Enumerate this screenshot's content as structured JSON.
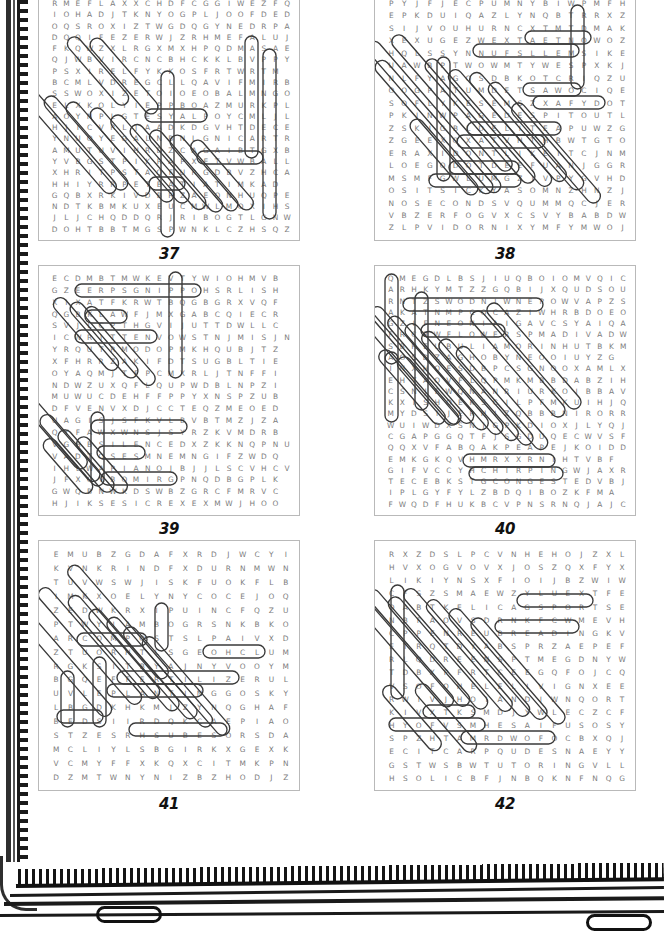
{
  "page": {
    "kind": "word-search-puzzle-book-page",
    "binding": "spiral-comb",
    "background_color": "#ffffff",
    "letter_color": "#7b7b7b",
    "circle_color": "#3a3a3a",
    "box_border_color": "#b9b9b9",
    "number_color": "#111111"
  },
  "puzzles": [
    {
      "number": "37",
      "rows": [
        "RMEFLAXXCHDFCGGIWEZFQ",
        "IOHADJTKNYOGPLJOOFDED",
        "OQSROXIZTWGDQGYNEDRPA",
        "DQQIFEZERWJZRHMEFALUJ",
        "FKQWZXLRGXMXHPQDMASAE",
        "QJWBVIRCNCBHCKKLBVPPY",
        "PSXIRELFYKKOSFRTWRTM",
        "BCMLVDREGCLLQAVIFMIRB",
        "SSWOXIZETOIOEOBALMNGO",
        "ELXKOLYIEPPBOAZMURKPL",
        "AOYNPLGTESYALPOYCMLJL",
        "HJICVRLJAADKDGVHTDECE",
        "YNUOYEGALNBNLGNICARTR",
        "AMUTUVIHRDZCAGAIBTGXB",
        "YVBGSTPIKRAPXETVWBALL",
        "XHRITPSTAQFURGDBVZHCA",
        "HHIYRRPETBATIATIMKAD",
        "GQBXRKIVDBRZAEONHUQPE",
        "NDTKBMKUXEUCMWLMOXIHS",
        "JLJCHQDDQRJRIBOGTLGNW",
        "DOHTBBTMGSPWNKLCZHSQZ"
      ]
    },
    {
      "number": "38",
      "rows": [
        "PYJFJECPUMNYBIWPMFH",
        "EPKDUIQAZLYNQBTRRXZ",
        "SIJVOUHURNCXTMTDMAK",
        "XEXUGEZWEXTAETNOWOZ",
        "HQLSSYNNUFSLLEMSIKE",
        "UAWBPTWOWMTYWESPXKJ",
        "NLFYAGOSDBKOTCRIQZU",
        "OOGPATUMDETSAWOCIQE",
        "SOFLYKESEMSZXAFYDOT",
        "PKJNWPAGEDESPITOUTL",
        "ZSKIGBLDELITEAPUWZG",
        "ZGEEXQXATVHTHBWTGTO",
        "ERAXIDONTLIKEITCJNM",
        "LOEGODOTDEEFUANJGGR",
        "MSMFGWLUMGZIVPYGVHD",
        "OSITSICKYASOMNZHNZJ",
        "NOSECONDSVQUMMQCJER",
        "VBZERFOGVXCSVYBABDW",
        "ZLPVIDORNIXYMFYMWOJ"
      ]
    },
    {
      "number": "39",
      "rows": [
        "ECDMBTMWKEVTYWIOHMVB",
        "GZEERPSGNIPPOHSRLISH",
        "XIXATFKRWTBQGBGRXVQF",
        "QGBKLAWFJMXGABCQIECR",
        "SVJLCPTHGVIJUTTDWLLC",
        "ICWRITTENVOWSTNJMISJN",
        "YRQUTRMODOPMKHQUBJTZ",
        "XFHRRZAKIFDTSUGBLTIE",
        "OYAQMJTFPCMXRLJTNFFI",
        "NDWZUXQFLQUPWDBLNPZI",
        "MUWUCDEHFFPPYXNSPZUB",
        "DFVENVXDJCCTEQZMEOED",
        "UAGISJSFKVLBVBTMZJZA",
        "QYFAWXWNSJSYRZKVMDRB",
        "VGHBSILENCEDXZKKNQPNU",
        "VADTQSESMNEMNGIFZWDQ",
        "IHLWAPIANOJBJJLSCVHCV",
        "JFXQVBQMIRGPNQDBGPLK",
        "GWQBNWKDSWBZGRCFMRVC",
        "HJIKSESICREXEXMWJHOO"
      ]
    },
    {
      "number": "40",
      "rows": [
        "QMEGDLBSJIUQBOIOMVQIC",
        "ARHKYMTZZGQBIJXQUDSOU",
        "RNTZSWODNIWNEPOWVAPZS",
        "AKATNMPCQCAZIWHRBDOEO",
        "GZIFNEONIAIGAVCSYAIQA",
        "FRCRWFLOWERSPMADIVADW",
        "SBHEUBULIAMORINHUTBKM",
        "AOSDZAGHOBYNEOOIUYZG",
        "INXHOESDBPCSGNOOXAMLX",
        "EHTAOVFLQPMKMBBDABZIH",
        "CSNJEWQNANRIURKOIBBAV",
        "KXISHOEKSCILPFMKUIHJQ",
        "MYDSIJERHIZQBBBNIRORR",
        "WUIWDXSNJGPKDIOXJLYQJ",
        "CGAPGGQTFJSGDUQECWVSF",
        "QQXVFABQAKPEAPEJKOIDD",
        "EMKGKQVHMRXXRNIHTVBF",
        "GIFVCCYHCHIRPINGWJAXR",
        "TECEBKSTGCONGESTEDVBJ",
        "IPLGYFYLZBDQIBOZKFMA",
        "FWQDFHUKBCVPNSRNQJAJC"
      ]
    },
    {
      "number": "41",
      "rows": [
        "EMUBZGDAFXRDJWCYI",
        "KVNKRINDFXDURNMWN",
        "TUVWSWJISKFUOKFLB",
        "IMKXOELYNYCOCEJOQ",
        "ZEDWKRXIPUINCFQZU",
        "PTWYIAMBOGRSNKBKO",
        "ARCOMPOSTSLPAIVXD",
        "ZTUORHTLSGEOHCLUM",
        "RGKSITBYAJNYVOOYM",
        "BGQEFFERTILIZERUL",
        "UVLEPLANTINGGOSKY",
        "LBGDKHKMJZYNQGHAF",
        "BEDSIIRDQKCAEPIAO",
        "STZESRHSUBESORSDA",
        "MCLIYLSBGIRKXGEXK",
        "VCMYFFXKQXCITMKPN",
        "DZMTWNYNIZBZHODJZ"
      ]
    },
    {
      "number": "42",
      "rows": [
        "RXZDSLPCVNHEHOJZXL",
        "HVXOGVOVXJOSZQXFYX",
        "LIKIYNSXFIOIJBZWIW",
        "CFSZSMAEWZYLUEXTFE",
        "OABTKELICAGSPORTSE",
        "NBFAOVSDRNKFCWMEVH",
        "CPPENREUBREADINGKV",
        "ETRQTDYABSPRZAEPEF",
        "RLQDREENSPTMEGDNYW",
        "TDBXPFRTCEEGQFOJCQ",
        "VSOFOHELELIVIGNXEE",
        "RWIVJHOIANDIWNQORT",
        "KIVXTKSMDJYWLECZCF",
        "HYOFVSMHESAIFUSOSY",
        "SPZHTAMRDWOFOCBXQJ",
        "ECITCARPQUDESNAEYY",
        "GSTWSBWTUTORINGVLL",
        "HSOLICBFJNBQKNFNQG"
      ]
    }
  ],
  "found_words": {
    "37": [
      "EASY",
      "PART",
      "TRACING"
    ],
    "38": [
      "NOW TEAT",
      "SMELLS FUN",
      "WASTED",
      "DESPITE OUT",
      "I DONT LIKE IT",
      "GO DOT DEEP",
      "IT S SICKY",
      "NO SECONDS"
    ],
    "39": [
      "SHOPPING",
      "WALK",
      "WRITTEN VOW",
      "SILENCE",
      "PIANO",
      "EXERCISES"
    ],
    "40": [
      "WINDOWS",
      "OPEN",
      "FLOWERS",
      "SHOES",
      "CHIRPING",
      "CONGESTED"
    ],
    "41": [
      "COMPOST",
      "MULCH",
      "FERTILIZER",
      "PLANTING",
      "BEDS",
      "ROSEBUSH"
    ],
    "42": [
      "SPORTS",
      "READING",
      "MATH",
      "PRACTICE",
      "TUTORING"
    ]
  },
  "highlights": {
    "37": [
      {
        "x": 52,
        "y": 37,
        "w": 14,
        "h": 86,
        "rot": -41
      },
      {
        "x": 78,
        "y": 37,
        "w": 14,
        "h": 96,
        "rot": -41
      },
      {
        "x": 22,
        "y": 78,
        "w": 14,
        "h": 140,
        "rot": -41
      },
      {
        "x": 40,
        "y": 92,
        "w": 14,
        "h": 120,
        "rot": -41
      },
      {
        "x": 62,
        "y": 98,
        "w": 14,
        "h": 120,
        "rot": -41
      },
      {
        "x": 86,
        "y": 104,
        "w": 14,
        "h": 120,
        "rot": -41
      },
      {
        "x": 104,
        "y": 112,
        "w": 14,
        "h": 112,
        "rot": -41
      },
      {
        "x": 122,
        "y": 122,
        "w": 14,
        "h": 108,
        "rot": -41
      },
      {
        "x": 140,
        "y": 128,
        "w": 14,
        "h": 104,
        "rot": -41
      },
      {
        "x": 158,
        "y": 134,
        "w": 14,
        "h": 96,
        "rot": -41
      },
      {
        "x": 176,
        "y": 140,
        "w": 14,
        "h": 88,
        "rot": -41
      },
      {
        "x": 106,
        "y": 118,
        "w": 62,
        "h": 13,
        "rot": 0
      },
      {
        "x": 158,
        "y": 160,
        "w": 66,
        "h": 13,
        "rot": 0
      },
      {
        "x": 110,
        "y": 186,
        "w": 36,
        "h": 13,
        "rot": 0
      },
      {
        "x": 206,
        "y": 45,
        "w": 13,
        "h": 122,
        "rot": 0
      },
      {
        "x": 224,
        "y": 58,
        "w": 13,
        "h": 170,
        "rot": 0
      },
      {
        "x": 122,
        "y": 80,
        "w": 13,
        "h": 166,
        "rot": 0
      }
    ],
    "38": [
      {
        "x": 52,
        "y": 28,
        "w": 14,
        "h": 196,
        "rot": -41
      },
      {
        "x": 70,
        "y": 24,
        "w": 14,
        "h": 176,
        "rot": -41
      },
      {
        "x": 52,
        "y": 50,
        "w": 14,
        "h": 172,
        "rot": -41
      },
      {
        "x": 98,
        "y": 50,
        "w": 14,
        "h": 160,
        "rot": -41
      },
      {
        "x": 118,
        "y": 62,
        "w": 14,
        "h": 150,
        "rot": -41
      },
      {
        "x": 136,
        "y": 66,
        "w": 14,
        "h": 140,
        "rot": -41
      },
      {
        "x": 154,
        "y": 76,
        "w": 14,
        "h": 138,
        "rot": -41
      },
      {
        "x": 174,
        "y": 98,
        "w": 14,
        "h": 128,
        "rot": -41
      },
      {
        "x": 62,
        "y": 118,
        "w": 14,
        "h": 96,
        "rot": -41
      },
      {
        "x": 150,
        "y": 40,
        "w": 66,
        "h": 13,
        "rot": 0
      },
      {
        "x": 98,
        "y": 53,
        "w": 106,
        "h": 13,
        "rot": 0
      },
      {
        "x": 148,
        "y": 92,
        "w": 58,
        "h": 13,
        "rot": 0
      },
      {
        "x": 158,
        "y": 105,
        "w": 72,
        "h": 13,
        "rot": 0
      },
      {
        "x": 92,
        "y": 131,
        "w": 94,
        "h": 13,
        "rot": 0
      },
      {
        "x": 82,
        "y": 144,
        "w": 88,
        "h": 13,
        "rot": 0
      },
      {
        "x": 74,
        "y": 170,
        "w": 70,
        "h": 13,
        "rot": 0
      },
      {
        "x": 54,
        "y": 183,
        "w": 92,
        "h": 13,
        "rot": 0
      },
      {
        "x": 62,
        "y": 66,
        "w": 13,
        "h": 124,
        "rot": 0
      },
      {
        "x": 196,
        "y": 14,
        "w": 13,
        "h": 84,
        "rot": 0
      }
    ],
    "39": [
      {
        "x": 130,
        "y": 6,
        "w": 13,
        "h": 106,
        "rot": 0
      },
      {
        "x": 36,
        "y": 18,
        "w": 126,
        "h": 13,
        "rot": 0
      },
      {
        "x": 46,
        "y": 44,
        "w": 42,
        "h": 13,
        "rot": 0
      },
      {
        "x": 36,
        "y": 64,
        "w": 82,
        "h": 13,
        "rot": 0
      },
      {
        "x": 52,
        "y": 154,
        "w": 96,
        "h": 13,
        "rot": 0
      },
      {
        "x": 58,
        "y": 180,
        "w": 48,
        "h": 13,
        "rot": 0
      },
      {
        "x": 62,
        "y": 206,
        "w": 76,
        "h": 13,
        "rot": 0
      },
      {
        "x": 40,
        "y": 22,
        "w": 14,
        "h": 92,
        "rot": -41
      },
      {
        "x": 58,
        "y": 26,
        "w": 14,
        "h": 96,
        "rot": -41
      },
      {
        "x": 74,
        "y": 30,
        "w": 14,
        "h": 100,
        "rot": -41
      },
      {
        "x": 10,
        "y": 124,
        "w": 14,
        "h": 88,
        "rot": -41
      },
      {
        "x": 24,
        "y": 140,
        "w": 14,
        "h": 84,
        "rot": -41
      },
      {
        "x": 40,
        "y": 156,
        "w": 14,
        "h": 78,
        "rot": -41
      },
      {
        "x": 56,
        "y": 164,
        "w": 14,
        "h": 70,
        "rot": -41
      },
      {
        "x": 22,
        "y": 166,
        "w": 14,
        "h": 68,
        "rot": -41
      },
      {
        "x": 52,
        "y": 146,
        "w": 13,
        "h": 74,
        "rot": 0
      }
    ],
    "40": [
      {
        "x": 10,
        "y": 8,
        "w": 13,
        "h": 90,
        "rot": 0
      },
      {
        "x": 40,
        "y": 26,
        "w": 13,
        "h": 118,
        "rot": 0
      },
      {
        "x": 10,
        "y": 86,
        "w": 13,
        "h": 70,
        "rot": 0
      },
      {
        "x": 28,
        "y": 32,
        "w": 140,
        "h": 13,
        "rot": 0
      },
      {
        "x": 46,
        "y": 58,
        "w": 84,
        "h": 13,
        "rot": 0
      },
      {
        "x": 88,
        "y": 188,
        "w": 92,
        "h": 13,
        "rot": 0
      },
      {
        "x": 94,
        "y": 201,
        "w": 94,
        "h": 13,
        "rot": 0
      },
      {
        "x": 24,
        "y": 16,
        "w": 14,
        "h": 160,
        "rot": -41
      },
      {
        "x": 40,
        "y": 24,
        "w": 14,
        "h": 150,
        "rot": -41
      },
      {
        "x": 56,
        "y": 34,
        "w": 14,
        "h": 146,
        "rot": -41
      },
      {
        "x": 72,
        "y": 42,
        "w": 14,
        "h": 142,
        "rot": -41
      },
      {
        "x": 88,
        "y": 50,
        "w": 14,
        "h": 140,
        "rot": -41
      },
      {
        "x": 104,
        "y": 58,
        "w": 14,
        "h": 136,
        "rot": -41
      },
      {
        "x": 120,
        "y": 66,
        "w": 14,
        "h": 132,
        "rot": -41
      },
      {
        "x": 136,
        "y": 30,
        "w": 14,
        "h": 136,
        "rot": -41
      },
      {
        "x": 152,
        "y": 22,
        "w": 14,
        "h": 136,
        "rot": -41
      },
      {
        "x": 30,
        "y": 74,
        "w": 14,
        "h": 94,
        "rot": -41
      },
      {
        "x": 46,
        "y": 82,
        "w": 14,
        "h": 86,
        "rot": -41
      }
    ],
    "41": [
      {
        "x": 72,
        "y": 8,
        "w": 14,
        "h": 146,
        "rot": -41
      },
      {
        "x": 44,
        "y": 30,
        "w": 14,
        "h": 150,
        "rot": -41
      },
      {
        "x": 14,
        "y": 42,
        "w": 14,
        "h": 150,
        "rot": -41
      },
      {
        "x": 68,
        "y": 40,
        "w": 14,
        "h": 132,
        "rot": -41
      },
      {
        "x": 88,
        "y": 54,
        "w": 14,
        "h": 130,
        "rot": -41
      },
      {
        "x": 106,
        "y": 62,
        "w": 14,
        "h": 130,
        "rot": -41
      },
      {
        "x": 122,
        "y": 72,
        "w": 14,
        "h": 128,
        "rot": -41
      },
      {
        "x": 140,
        "y": 82,
        "w": 14,
        "h": 126,
        "rot": -41
      },
      {
        "x": 38,
        "y": 92,
        "w": 70,
        "h": 13,
        "rot": 0
      },
      {
        "x": 164,
        "y": 104,
        "w": 62,
        "h": 13,
        "rot": 0
      },
      {
        "x": 78,
        "y": 130,
        "w": 122,
        "h": 13,
        "rot": 0
      },
      {
        "x": 68,
        "y": 143,
        "w": 96,
        "h": 13,
        "rot": 0
      },
      {
        "x": 18,
        "y": 169,
        "w": 46,
        "h": 13,
        "rot": 0
      },
      {
        "x": 90,
        "y": 182,
        "w": 98,
        "h": 13,
        "rot": 0
      },
      {
        "x": 22,
        "y": 130,
        "w": 13,
        "h": 56,
        "rot": 0
      },
      {
        "x": 54,
        "y": 116,
        "w": 13,
        "h": 70,
        "rot": 0
      },
      {
        "x": 116,
        "y": 62,
        "w": 13,
        "h": 48,
        "rot": 0
      }
    ],
    "42": [
      {
        "x": 16,
        "y": 22,
        "w": 14,
        "h": 162,
        "rot": -41
      },
      {
        "x": 36,
        "y": 32,
        "w": 14,
        "h": 150,
        "rot": -41
      },
      {
        "x": 56,
        "y": 40,
        "w": 14,
        "h": 144,
        "rot": -41
      },
      {
        "x": 76,
        "y": 30,
        "w": 14,
        "h": 158,
        "rot": -41
      },
      {
        "x": 96,
        "y": 42,
        "w": 14,
        "h": 150,
        "rot": -41
      },
      {
        "x": 116,
        "y": 52,
        "w": 14,
        "h": 142,
        "rot": -41
      },
      {
        "x": 136,
        "y": 62,
        "w": 14,
        "h": 136,
        "rot": -41
      },
      {
        "x": 64,
        "y": 134,
        "w": 14,
        "h": 86,
        "rot": -41
      },
      {
        "x": 30,
        "y": 136,
        "w": 14,
        "h": 82,
        "rot": -41
      },
      {
        "x": 142,
        "y": 53,
        "w": 76,
        "h": 13,
        "rot": 0
      },
      {
        "x": 120,
        "y": 79,
        "w": 84,
        "h": 13,
        "rot": 0
      },
      {
        "x": 16,
        "y": 44,
        "w": 13,
        "h": 114,
        "rot": 0
      },
      {
        "x": 48,
        "y": 164,
        "w": 52,
        "h": 13,
        "rot": 0
      },
      {
        "x": 14,
        "y": 177,
        "w": 96,
        "h": 13,
        "rot": 0
      },
      {
        "x": 86,
        "y": 190,
        "w": 94,
        "h": 13,
        "rot": 0
      }
    ]
  }
}
